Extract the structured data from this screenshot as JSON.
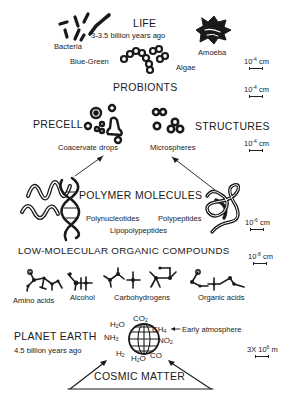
{
  "life": {
    "title": "LIFE",
    "age": "3-3.5  billion years ago",
    "labels": {
      "bacteria": "Bacteria",
      "blue_green": "Blue-Green",
      "algae": "Algae",
      "amoeba": "Amoeba"
    },
    "scale": {
      "base": "10",
      "exp": "-4",
      "unit": "cm"
    }
  },
  "probionts": {
    "title": "PROBIONTS",
    "scale": {
      "base": "10",
      "exp": "-4",
      "unit": "cm"
    }
  },
  "precell": {
    "left_title": "PRECELL",
    "right_title": "STRUCTURES",
    "labels": {
      "coacervate": "Coacervate drops",
      "microspheres": "Microspheres"
    },
    "scale": {
      "base": "10",
      "exp": "-4",
      "unit": "cm"
    }
  },
  "polymers": {
    "title": "POLYMER MOLECULES",
    "labels": {
      "polynucleotides": "Polynucleotides",
      "polypeptides": "Polypeptides",
      "lipopolypeptides": "Lipopolypeptides"
    },
    "scale": {
      "base": "10",
      "exp": "-6",
      "unit": "cm"
    }
  },
  "low_molecular": {
    "title": "LOW-MOLECULAR ORGANIC COMPOUNDS",
    "labels": {
      "amino_acids": "Amino acids",
      "alcohol": "Alcohol",
      "carbohydrogens": "Carbohydrogens",
      "organic_acids": "Organic acids"
    },
    "scale": {
      "base": "10",
      "exp": "-8",
      "unit": "cm"
    }
  },
  "earth": {
    "title": "PLANET EARTH",
    "age": "4.5 billion years ago",
    "molecules": {
      "co2": {
        "base": "CO",
        "sub": "2"
      },
      "h2o_top": {
        "base": "H",
        "sub": "2",
        "rest": "O"
      },
      "ch4": {
        "base": "CH",
        "sub": "4"
      },
      "nh3": {
        "base": "NH",
        "sub": "3"
      },
      "no2": {
        "base": "NO",
        "sub": "2"
      },
      "h2": {
        "base": "H",
        "sub": "2"
      },
      "h2o_bottom": {
        "base": "H",
        "sub": "2",
        "rest": "O"
      },
      "co": "CO"
    },
    "atmosphere_label": "Early atmosphere",
    "scale": {
      "base": "3X 10",
      "exp": "6",
      "unit": "m"
    }
  },
  "cosmic": {
    "title": "COSMIC MATTER"
  },
  "colors": {
    "ink": "#1a1a1a",
    "background": "#ffffff"
  }
}
